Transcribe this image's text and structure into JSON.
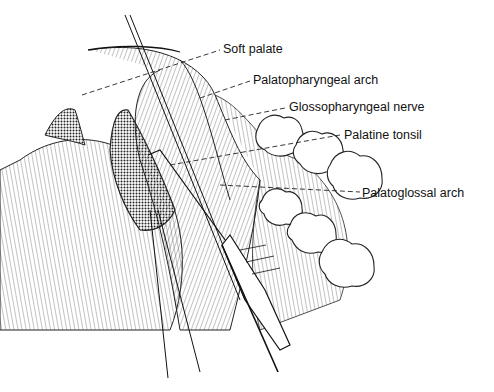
{
  "figure": {
    "labels": [
      {
        "id": "soft-palate",
        "text": "Soft palate"
      },
      {
        "id": "palatopharyngeal-arch",
        "text": "Palatopharyngeal arch"
      },
      {
        "id": "glossopharyngeal-nerve",
        "text": "Glossopharyngeal nerve"
      },
      {
        "id": "palatine-tonsil",
        "text": "Palatine tonsil"
      },
      {
        "id": "palatoglossal-arch",
        "text": "Palatoglossal arch"
      }
    ]
  }
}
